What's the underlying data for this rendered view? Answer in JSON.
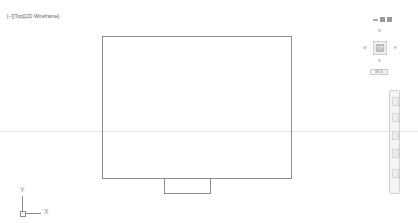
{
  "viewport": {
    "controls": "[−]",
    "view": "[Top]",
    "visual_style": "[2D Wireframe]"
  },
  "navcube": {
    "north": "N",
    "south": "S",
    "east": "E",
    "west": "W",
    "face": "TOP",
    "coordinate_system": "WCS"
  },
  "ucs": {
    "x_label": "X",
    "y_label": "Y"
  },
  "navbar": {
    "buttons": [
      "full-navigation-wheel",
      "pan",
      "zoom-extents",
      "orbit",
      "showmotion"
    ]
  },
  "drawing": {
    "main_rectangle": {
      "x": 102,
      "y": 36,
      "width": 190,
      "height": 143
    },
    "tab_rectangle": {
      "x": 164,
      "y": 178,
      "width": 47,
      "height": 16
    }
  },
  "colors": {
    "background": "#ffffff",
    "geometry": "#8c8c8c",
    "ui_gray": "#9a9a9a"
  }
}
